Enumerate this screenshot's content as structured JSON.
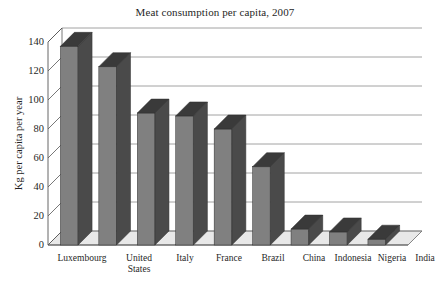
{
  "chart_data": {
    "type": "bar",
    "title": "Meat consumption per capita, 2007",
    "xlabel": "",
    "ylabel": "Kg per capita per year",
    "categories": [
      "Luxembourg",
      "United States",
      "Italy",
      "France",
      "Brazil",
      "China",
      "Indonesia",
      "Nigeria",
      "India"
    ],
    "values": [
      137,
      123,
      91,
      89,
      80,
      54,
      11,
      9,
      4
    ],
    "ylim": [
      0,
      140
    ],
    "yticks": [
      0,
      20,
      40,
      60,
      80,
      100,
      120,
      140
    ],
    "ytick_labels": [
      "0",
      "20",
      "40",
      "60",
      "80",
      "100",
      "120",
      "140"
    ],
    "grid": true,
    "legend": false,
    "style": "3d-column",
    "series": [
      {
        "name": "Meat consumption",
        "values": [
          137,
          123,
          91,
          89,
          80,
          54,
          11,
          9,
          4
        ]
      }
    ],
    "category_label_lines": [
      [
        "Luxembourg"
      ],
      [
        "United",
        "States"
      ],
      [
        "Italy"
      ],
      [
        "France"
      ],
      [
        "Brazil"
      ],
      [
        "China"
      ],
      [
        "Indonesia"
      ],
      [
        "Nigeria"
      ],
      [
        "India"
      ]
    ],
    "colors": {
      "bar_front": "#808080",
      "bar_side": "#4a4a4a",
      "bar_top": "#3a3a3a",
      "grid_line": "#8c8c8c",
      "axis_line": "#555555",
      "floor": "#e8e8e8",
      "background": "#ffffff",
      "text": "#1f1f1f"
    }
  }
}
